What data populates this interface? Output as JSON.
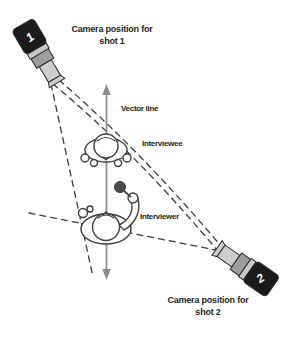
{
  "figure": {
    "type": "camera-setup-diagram",
    "labels": {
      "camera1_caption": {
        "line1": "Camera position for",
        "line2": "shot 1"
      },
      "camera2_caption": {
        "line1": "Camera position for",
        "line2": "shot 2"
      },
      "vector_line": "Vector line",
      "interviewee": "Interviewee",
      "interviewer": "Interviewer"
    },
    "cameras": {
      "camera1": {
        "digit": "1"
      },
      "camera2": {
        "digit": "2"
      }
    },
    "colors": {
      "camera_body": "#1b1b1b",
      "camera_mid": "#9d9d9d",
      "camera_strip": "#c7c7c7",
      "camera_barrel": "#cdcdcd",
      "camera_digit": "#ffffff",
      "vector_arrow": "#8c8c8c",
      "dashed_line": "#3c3c3c",
      "microphone": "#4a4a4a",
      "text": "#231f20",
      "background": "#ffffff"
    }
  }
}
